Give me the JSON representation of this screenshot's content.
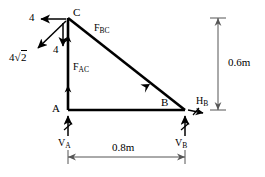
{
  "figure": {
    "type": "truss-free-body-diagram",
    "width": 265,
    "height": 177,
    "background_color": "#ffffff",
    "line_color": "#000000"
  },
  "nodes": [
    {
      "id": "C",
      "label": "C",
      "x": 68,
      "y": 18
    },
    {
      "id": "A",
      "label": "A",
      "x": 68,
      "y": 110
    },
    {
      "id": "B",
      "label": "B",
      "x": 185,
      "y": 110
    }
  ],
  "members": [
    {
      "id": "AC",
      "label": "F",
      "subscript": "AC",
      "from": "A",
      "to": "C"
    },
    {
      "id": "BC",
      "label": "F",
      "subscript": "BC",
      "from": "B",
      "to": "C"
    },
    {
      "id": "AB",
      "label": "",
      "subscript": "",
      "from": "A",
      "to": "B"
    }
  ],
  "applied_loads": [
    {
      "name": "horizontal-load-at-C",
      "magnitude": "4",
      "direction": "left"
    },
    {
      "name": "vertical-load-at-C",
      "magnitude": "4",
      "direction": "down"
    },
    {
      "name": "resultant-load-at-C",
      "magnitude": "4",
      "radical": "2",
      "direction": "down-left"
    }
  ],
  "reactions": [
    {
      "name": "vertical-reaction-a",
      "label": "V",
      "subscript": "A",
      "direction": "up"
    },
    {
      "name": "vertical-reaction-b",
      "label": "V",
      "subscript": "B",
      "direction": "up"
    },
    {
      "name": "horizontal-reaction-b",
      "label": "H",
      "subscript": "B",
      "direction": "right"
    }
  ],
  "dimensions": [
    {
      "name": "height-dimension",
      "value": "0.6m",
      "orientation": "vertical"
    },
    {
      "name": "span-dimension",
      "value": "0.8m",
      "orientation": "horizontal"
    }
  ]
}
